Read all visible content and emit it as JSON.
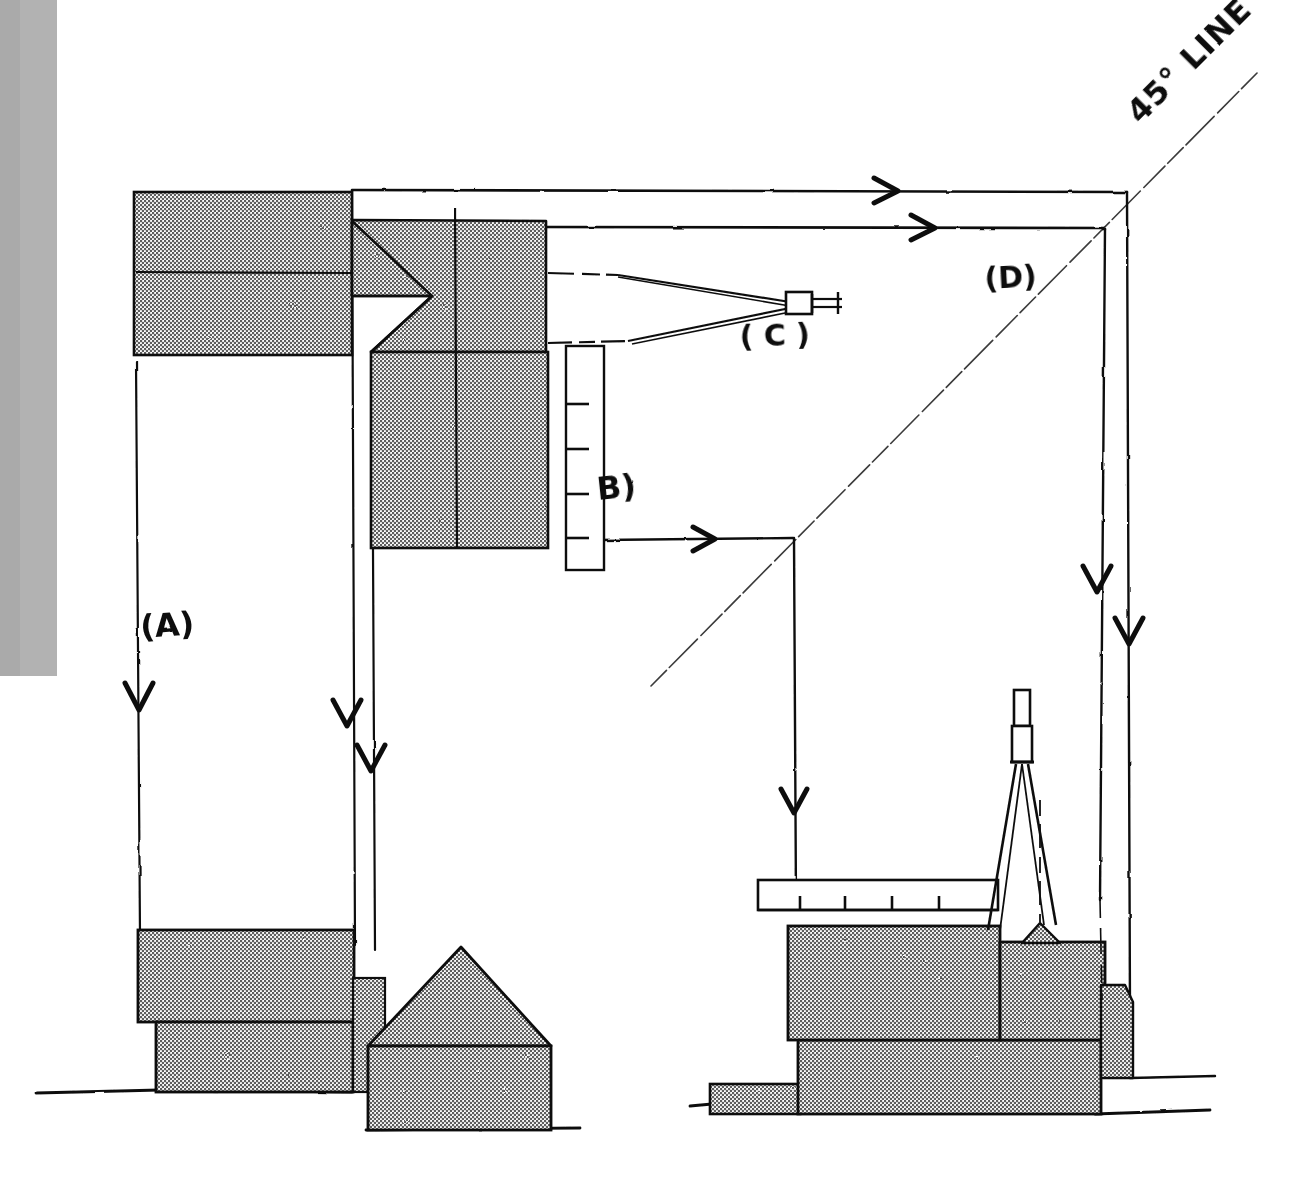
{
  "drawing": {
    "medium": "hand-drawn pencil/ink technical sketch",
    "background_color": "#ffffff",
    "ink_color": "#111111",
    "fill_gray": "#a8a8a8",
    "margin_shadow_color": "#b0b0b0"
  },
  "labels": {
    "a": "(A)",
    "b": "B)",
    "c": "( C )",
    "d": "(D)",
    "line_45": "45° LINE"
  },
  "annotations": {
    "a_meaning": "vertical transfer line left side",
    "b_meaning": "vertical graduated staff / scale rod",
    "c_meaning": "surveying instrument sighting target",
    "d_meaning": "upper right transfer path",
    "line_45_meaning": "forty-five degree construction line"
  },
  "elements": {
    "ground_line_left": "ground-line-left",
    "ground_line_right": "ground-line-right",
    "tripod_instrument": "tripod-instrument",
    "horizontal_rod": "horizontal-graduated-rod",
    "vertical_staff": "vertical-graduated-staff",
    "gable_building": "gable-roof-building",
    "flat_building": "flat-roof-building"
  },
  "graduations": {
    "vertical_staff_ticks": 4,
    "horizontal_rod_ticks": 4
  },
  "arrows": {
    "top_horizontal_count": 2,
    "left_vertical_count": 3,
    "right_vertical_count": 3,
    "middle_horizontal_count": 1,
    "middle_vertical_count": 1
  }
}
